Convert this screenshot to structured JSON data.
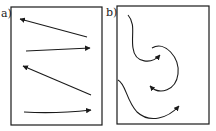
{
  "panels": [
    {
      "label": "a)",
      "description": "straight arrows in alternating zigzag directions",
      "frame": {
        "x": 11,
        "y": 7,
        "w": 91,
        "h": 118
      },
      "arrows": [
        {
          "path": "M87,37 L20,19",
          "head": "left"
        },
        {
          "path": "M26,51 L90,48",
          "head": "right"
        },
        {
          "path": "M91,95 L23,66",
          "head": "upper-left"
        },
        {
          "path": "M24,112 Q55,114 91,110",
          "head": "right"
        }
      ]
    },
    {
      "label": "b)",
      "description": "curved meandering arrows",
      "frame": {
        "x": 117,
        "y": 6,
        "w": 92,
        "h": 118
      },
      "arrows": [
        {
          "path": "M128,15 C136,24 131,36 133,48 C135,64 152,64 160,55",
          "head": "right"
        },
        {
          "path": "M152,48 C165,40 180,58 178,74 C176,90 160,96 150,86",
          "head": "upper-left"
        },
        {
          "path": "M118,80 C126,84 126,100 137,112 C150,124 168,118 179,106",
          "head": "upper-right"
        }
      ]
    }
  ],
  "colors": {
    "stroke": "#1a1a1a",
    "background": "#ffffff"
  }
}
